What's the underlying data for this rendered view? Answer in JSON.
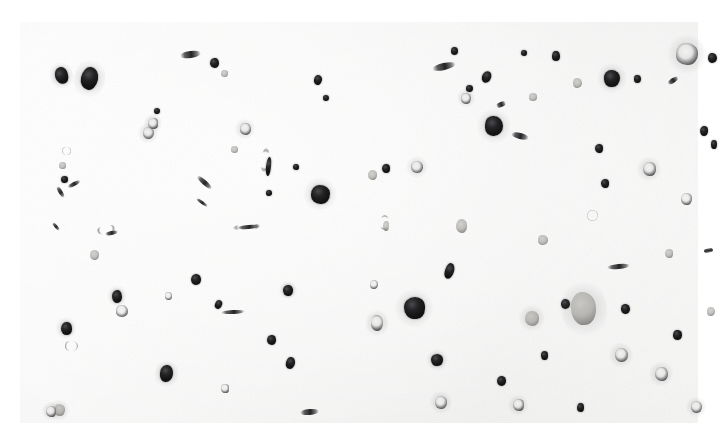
{
  "image": {
    "kind": "scanned-specimen-sheet",
    "description": "Grayscale scan of a microfiche-like sheet: a regular grid of miniature printed text page blocks overlaid with scattered dark particulate blobs",
    "canvas": {
      "width": 728,
      "height": 440
    },
    "outer_background": "#ffffff",
    "sheet": {
      "x": 20,
      "y": 22,
      "width": 678,
      "height": 401,
      "paper_color": "#f6f6f5",
      "highlight_color": "#fdfdfd",
      "shadow_color": "#eeeeed"
    },
    "page_grid": {
      "columns": 14,
      "rows": 7,
      "cell_width": 48.4,
      "cell_height": 57.3,
      "block_width": 38,
      "block_height": 47,
      "ink_color": "#5f5f64",
      "ink_opacity": 0.62
    },
    "palette": {
      "particle_dark": "#141415",
      "particle_mid": "#4a4a4c",
      "particle_soft": "#a8a6a2",
      "particle_ring_light": "#f0f0ef",
      "paper": "#f6f6f5",
      "white": "#ffffff"
    },
    "particle_kinds": {
      "k-dark": "opaque-dark-round-particle",
      "k-ring": "ring-annulus-particle",
      "k-soft": "translucent-gray-vesicle",
      "k-sliver": "elongated-fibre-sliver",
      "k-bubble": "faint-outline-bubble"
    },
    "particle_count": 96,
    "particles": [
      {
        "x": 41,
        "y": 53,
        "w": 13,
        "h": 17,
        "kind": "k-dark",
        "rot": -16,
        "halo": 1
      },
      {
        "x": 69,
        "y": 56,
        "w": 17,
        "h": 23,
        "kind": "k-dark",
        "rot": 12,
        "halo": 1
      },
      {
        "x": 128,
        "y": 111,
        "w": 11,
        "h": 12,
        "kind": "k-ring",
        "rot": 0,
        "halo": 1
      },
      {
        "x": 137,
        "y": 89,
        "w": 6,
        "h": 6,
        "kind": "k-dark",
        "rot": 0,
        "halo": 0
      },
      {
        "x": 46,
        "y": 129,
        "w": 9,
        "h": 8,
        "kind": "k-bubble",
        "rot": 0,
        "halo": 0
      },
      {
        "x": 42,
        "y": 143,
        "w": 7,
        "h": 7,
        "kind": "k-soft",
        "rot": 0,
        "halo": 0
      },
      {
        "x": 44,
        "y": 157,
        "w": 7,
        "h": 7,
        "kind": "k-dark",
        "rot": 0,
        "halo": 0
      },
      {
        "x": 54,
        "y": 162,
        "w": 14,
        "h": 4,
        "kind": "k-sliver",
        "rot": -28,
        "halo": 0
      },
      {
        "x": 194,
        "y": 41,
        "w": 9,
        "h": 10,
        "kind": "k-dark",
        "rot": 0,
        "halo": 0
      },
      {
        "x": 204,
        "y": 51,
        "w": 7,
        "h": 7,
        "kind": "k-soft",
        "rot": 0,
        "halo": 0
      },
      {
        "x": 170,
        "y": 32,
        "w": 21,
        "h": 7,
        "kind": "k-sliver",
        "rot": -8,
        "halo": 0
      },
      {
        "x": 298,
        "y": 58,
        "w": 8,
        "h": 10,
        "kind": "k-dark",
        "rot": 10,
        "halo": 0
      },
      {
        "x": 306,
        "y": 76,
        "w": 6,
        "h": 6,
        "kind": "k-dark",
        "rot": 0,
        "halo": 0
      },
      {
        "x": 225,
        "y": 107,
        "w": 11,
        "h": 12,
        "kind": "k-ring",
        "rot": 0,
        "halo": 1
      },
      {
        "x": 214,
        "y": 127,
        "w": 7,
        "h": 7,
        "kind": "k-soft",
        "rot": 0,
        "halo": 0
      },
      {
        "x": 133,
        "y": 101,
        "w": 10,
        "h": 11,
        "kind": "k-ring",
        "rot": 0,
        "halo": 1
      },
      {
        "x": 245,
        "y": 138,
        "w": 8,
        "h": 24,
        "kind": "k-bubble",
        "rot": 6,
        "halo": 0
      },
      {
        "x": 248,
        "y": 144,
        "w": 5,
        "h": 19,
        "kind": "k-dark",
        "rot": 6,
        "halo": 0
      },
      {
        "x": 249,
        "y": 171,
        "w": 6,
        "h": 6,
        "kind": "k-dark",
        "rot": 0,
        "halo": 0
      },
      {
        "x": 276,
        "y": 145,
        "w": 6,
        "h": 6,
        "kind": "k-dark",
        "rot": 0,
        "halo": 0
      },
      {
        "x": 300,
        "y": 172,
        "w": 19,
        "h": 19,
        "kind": "k-dark",
        "rot": 0,
        "halo": 1
      },
      {
        "x": 184,
        "y": 160,
        "w": 19,
        "h": 5,
        "kind": "k-sliver",
        "rot": 42,
        "halo": 0
      },
      {
        "x": 182,
        "y": 180,
        "w": 14,
        "h": 3,
        "kind": "k-sliver",
        "rot": 35,
        "halo": 0
      },
      {
        "x": 226,
        "y": 205,
        "w": 27,
        "h": 6,
        "kind": "k-bubble",
        "rot": -4,
        "halo": 0
      },
      {
        "x": 228,
        "y": 205,
        "w": 23,
        "h": 4,
        "kind": "k-sliver",
        "rot": -4,
        "halo": 0
      },
      {
        "x": 176,
        "y": 257,
        "w": 10,
        "h": 11,
        "kind": "k-dark",
        "rot": 0,
        "halo": 0
      },
      {
        "x": 198,
        "y": 282,
        "w": 7,
        "h": 9,
        "kind": "k-dark",
        "rot": 22,
        "halo": 0
      },
      {
        "x": 213,
        "y": 290,
        "w": 24,
        "h": 4,
        "kind": "k-sliver",
        "rot": -3,
        "halo": 0
      },
      {
        "x": 146,
        "y": 351,
        "w": 13,
        "h": 17,
        "kind": "k-dark",
        "rot": 9,
        "halo": 1
      },
      {
        "x": 205,
        "y": 366,
        "w": 8,
        "h": 9,
        "kind": "k-ring",
        "rot": 0,
        "halo": 0
      },
      {
        "x": 148,
        "y": 274,
        "w": 7,
        "h": 8,
        "kind": "k-ring",
        "rot": 0,
        "halo": 0
      },
      {
        "x": 97,
        "y": 274,
        "w": 10,
        "h": 13,
        "kind": "k-dark",
        "rot": 0,
        "halo": 1
      },
      {
        "x": 102,
        "y": 289,
        "w": 12,
        "h": 12,
        "kind": "k-ring",
        "rot": 0,
        "halo": 0
      },
      {
        "x": 46,
        "y": 306,
        "w": 11,
        "h": 13,
        "kind": "k-dark",
        "rot": 0,
        "halo": 1
      },
      {
        "x": 51,
        "y": 324,
        "w": 13,
        "h": 10,
        "kind": "k-bubble",
        "rot": 0,
        "halo": 0
      },
      {
        "x": 39,
        "y": 388,
        "w": 11,
        "h": 12,
        "kind": "k-soft",
        "rot": 0,
        "halo": 1
      },
      {
        "x": 40,
        "y": 170,
        "w": 13,
        "h": 4,
        "kind": "k-sliver",
        "rot": 58,
        "halo": 0
      },
      {
        "x": 36,
        "y": 204,
        "w": 10,
        "h": 3,
        "kind": "k-sliver",
        "rot": 50,
        "halo": 0
      },
      {
        "x": 86,
        "y": 207,
        "w": 18,
        "h": 9,
        "kind": "k-bubble",
        "rot": -12,
        "halo": 0
      },
      {
        "x": 91,
        "y": 211,
        "w": 13,
        "h": 4,
        "kind": "k-sliver",
        "rot": -12,
        "halo": 0
      },
      {
        "x": 74,
        "y": 233,
        "w": 9,
        "h": 10,
        "kind": "k-soft",
        "rot": 0,
        "halo": 0
      },
      {
        "x": 352,
        "y": 153,
        "w": 9,
        "h": 10,
        "kind": "k-soft",
        "rot": 0,
        "halo": 0
      },
      {
        "x": 366,
        "y": 146,
        "w": 8,
        "h": 9,
        "kind": "k-dark",
        "rot": 0,
        "halo": 0
      },
      {
        "x": 397,
        "y": 145,
        "w": 12,
        "h": 12,
        "kind": "k-ring",
        "rot": 0,
        "halo": 1
      },
      {
        "x": 424,
        "y": 44,
        "w": 24,
        "h": 7,
        "kind": "k-sliver",
        "rot": -13,
        "halo": 0
      },
      {
        "x": 434,
        "y": 29,
        "w": 7,
        "h": 8,
        "kind": "k-dark",
        "rot": 0,
        "halo": 0
      },
      {
        "x": 466,
        "y": 55,
        "w": 9,
        "h": 12,
        "kind": "k-dark",
        "rot": 24,
        "halo": 0
      },
      {
        "x": 481,
        "y": 82,
        "w": 10,
        "h": 5,
        "kind": "k-sliver",
        "rot": -22,
        "halo": 0
      },
      {
        "x": 446,
        "y": 76,
        "w": 10,
        "h": 11,
        "kind": "k-ring",
        "rot": 0,
        "halo": 1
      },
      {
        "x": 449,
        "y": 66,
        "w": 7,
        "h": 7,
        "kind": "k-dark",
        "rot": 0,
        "halo": 0
      },
      {
        "x": 474,
        "y": 104,
        "w": 18,
        "h": 20,
        "kind": "k-dark",
        "rot": 0,
        "halo": 1
      },
      {
        "x": 500,
        "y": 114,
        "w": 18,
        "h": 6,
        "kind": "k-sliver",
        "rot": 14,
        "halo": 0
      },
      {
        "x": 513,
        "y": 75,
        "w": 8,
        "h": 8,
        "kind": "k-soft",
        "rot": 0,
        "halo": 0
      },
      {
        "x": 536,
        "y": 34,
        "w": 8,
        "h": 10,
        "kind": "k-dark",
        "rot": 0,
        "halo": 0
      },
      {
        "x": 504,
        "y": 31,
        "w": 6,
        "h": 6,
        "kind": "k-dark",
        "rot": 0,
        "halo": 0
      },
      {
        "x": 592,
        "y": 56,
        "w": 16,
        "h": 17,
        "kind": "k-dark",
        "rot": 0,
        "halo": 1
      },
      {
        "x": 617,
        "y": 57,
        "w": 7,
        "h": 8,
        "kind": "k-dark",
        "rot": 0,
        "halo": 0
      },
      {
        "x": 579,
        "y": 126,
        "w": 8,
        "h": 9,
        "kind": "k-dark",
        "rot": 0,
        "halo": 0
      },
      {
        "x": 557,
        "y": 61,
        "w": 9,
        "h": 10,
        "kind": "k-soft",
        "rot": 0,
        "halo": 0
      },
      {
        "x": 667,
        "y": 32,
        "w": 22,
        "h": 22,
        "kind": "k-ring",
        "rot": 0,
        "halo": 1
      },
      {
        "x": 692,
        "y": 36,
        "w": 9,
        "h": 10,
        "kind": "k-dark",
        "rot": 0,
        "halo": 0
      },
      {
        "x": 653,
        "y": 58,
        "w": 12,
        "h": 5,
        "kind": "k-sliver",
        "rot": -34,
        "halo": 0
      },
      {
        "x": 684,
        "y": 109,
        "w": 8,
        "h": 10,
        "kind": "k-dark",
        "rot": 0,
        "halo": 0
      },
      {
        "x": 694,
        "y": 122,
        "w": 6,
        "h": 9,
        "kind": "k-dark",
        "rot": 0,
        "halo": 0
      },
      {
        "x": 629,
        "y": 147,
        "w": 13,
        "h": 14,
        "kind": "k-ring",
        "rot": 0,
        "halo": 1
      },
      {
        "x": 585,
        "y": 161,
        "w": 8,
        "h": 9,
        "kind": "k-dark",
        "rot": 0,
        "halo": 0
      },
      {
        "x": 666,
        "y": 177,
        "w": 11,
        "h": 12,
        "kind": "k-ring",
        "rot": 0,
        "halo": 0
      },
      {
        "x": 572,
        "y": 193,
        "w": 11,
        "h": 11,
        "kind": "k-bubble",
        "rot": 0,
        "halo": 0
      },
      {
        "x": 441,
        "y": 204,
        "w": 11,
        "h": 14,
        "kind": "k-soft",
        "rot": 0,
        "halo": 0
      },
      {
        "x": 364,
        "y": 200,
        "w": 9,
        "h": 15,
        "kind": "k-bubble",
        "rot": 4,
        "halo": 0
      },
      {
        "x": 366,
        "y": 204,
        "w": 6,
        "h": 10,
        "kind": "k-soft",
        "rot": 4,
        "halo": 0
      },
      {
        "x": 523,
        "y": 218,
        "w": 10,
        "h": 10,
        "kind": "k-soft",
        "rot": 0,
        "halo": 0
      },
      {
        "x": 429,
        "y": 249,
        "w": 9,
        "h": 16,
        "kind": "k-dark",
        "rot": 18,
        "halo": 0
      },
      {
        "x": 598,
        "y": 244,
        "w": 23,
        "h": 5,
        "kind": "k-sliver",
        "rot": -6,
        "halo": 0
      },
      {
        "x": 649,
        "y": 231,
        "w": 8,
        "h": 9,
        "kind": "k-soft",
        "rot": 0,
        "halo": 0
      },
      {
        "x": 354,
        "y": 262,
        "w": 8,
        "h": 9,
        "kind": "k-ring",
        "rot": 0,
        "halo": 0
      },
      {
        "x": 268,
        "y": 268,
        "w": 10,
        "h": 11,
        "kind": "k-dark",
        "rot": 0,
        "halo": 1
      },
      {
        "x": 394,
        "y": 286,
        "w": 21,
        "h": 22,
        "kind": "k-dark",
        "rot": 0,
        "halo": 1
      },
      {
        "x": 357,
        "y": 301,
        "w": 12,
        "h": 16,
        "kind": "k-ring",
        "rot": 0,
        "halo": 1
      },
      {
        "x": 545,
        "y": 282,
        "w": 9,
        "h": 10,
        "kind": "k-dark",
        "rot": 0,
        "halo": 0
      },
      {
        "x": 563,
        "y": 286,
        "w": 25,
        "h": 33,
        "kind": "k-soft",
        "rot": -6,
        "halo": 1
      },
      {
        "x": 605,
        "y": 287,
        "w": 9,
        "h": 10,
        "kind": "k-dark",
        "rot": 0,
        "halo": 0
      },
      {
        "x": 657,
        "y": 313,
        "w": 9,
        "h": 10,
        "kind": "k-dark",
        "rot": 0,
        "halo": 0
      },
      {
        "x": 691,
        "y": 289,
        "w": 8,
        "h": 9,
        "kind": "k-soft",
        "rot": 0,
        "halo": 0
      },
      {
        "x": 601,
        "y": 333,
        "w": 13,
        "h": 14,
        "kind": "k-ring",
        "rot": 0,
        "halo": 1
      },
      {
        "x": 524,
        "y": 333,
        "w": 7,
        "h": 9,
        "kind": "k-dark",
        "rot": 0,
        "halo": 0
      },
      {
        "x": 417,
        "y": 338,
        "w": 12,
        "h": 12,
        "kind": "k-dark",
        "rot": 0,
        "halo": 1
      },
      {
        "x": 421,
        "y": 380,
        "w": 12,
        "h": 13,
        "kind": "k-ring",
        "rot": 0,
        "halo": 1
      },
      {
        "x": 481,
        "y": 359,
        "w": 9,
        "h": 10,
        "kind": "k-dark",
        "rot": 0,
        "halo": 0
      },
      {
        "x": 512,
        "y": 296,
        "w": 14,
        "h": 15,
        "kind": "k-soft",
        "rot": 0,
        "halo": 1
      },
      {
        "x": 641,
        "y": 352,
        "w": 13,
        "h": 14,
        "kind": "k-ring",
        "rot": 0,
        "halo": 1
      },
      {
        "x": 676,
        "y": 385,
        "w": 11,
        "h": 12,
        "kind": "k-ring",
        "rot": 0,
        "halo": 1
      },
      {
        "x": 560,
        "y": 385,
        "w": 7,
        "h": 9,
        "kind": "k-dark",
        "rot": 0,
        "halo": 0
      },
      {
        "x": 498,
        "y": 383,
        "w": 11,
        "h": 12,
        "kind": "k-ring",
        "rot": 0,
        "halo": 1
      },
      {
        "x": 289,
        "y": 390,
        "w": 19,
        "h": 6,
        "kind": "k-sliver",
        "rot": -5,
        "halo": 0
      },
      {
        "x": 270,
        "y": 341,
        "w": 9,
        "h": 12,
        "kind": "k-dark",
        "rot": 14,
        "halo": 0
      },
      {
        "x": 251,
        "y": 318,
        "w": 9,
        "h": 10,
        "kind": "k-dark",
        "rot": 0,
        "halo": 0
      },
      {
        "x": 31,
        "y": 389,
        "w": 10,
        "h": 11,
        "kind": "k-ring",
        "rot": 0,
        "halo": 1
      },
      {
        "x": 688,
        "y": 228,
        "w": 5,
        "h": 9,
        "kind": "k-sliver",
        "rot": 80,
        "halo": 0
      }
    ]
  }
}
